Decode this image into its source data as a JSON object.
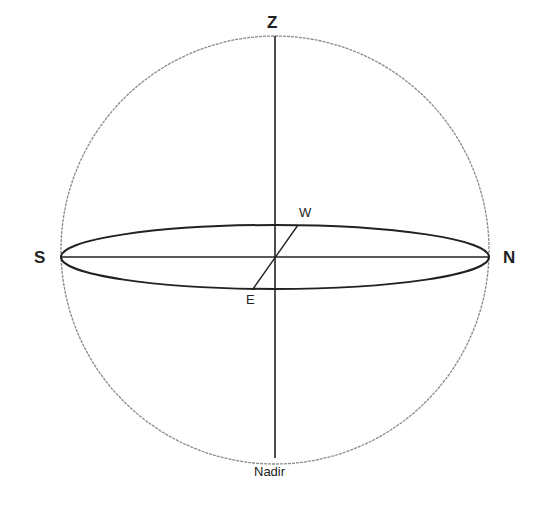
{
  "diagram": {
    "labels": {
      "zenith": "Z",
      "nadir": "Nadir",
      "south": "S",
      "north": "N",
      "west": "W",
      "east": "E"
    },
    "colors": {
      "sphere_outline": "#8a8a8a",
      "lines": "#222222",
      "text": "#222222",
      "background": "#ffffff"
    },
    "geometry": {
      "center": [
        275,
        257
      ],
      "sphere_radius": 214,
      "horizon_ellipse_rx": 214,
      "horizon_ellipse_ry": 32
    }
  }
}
